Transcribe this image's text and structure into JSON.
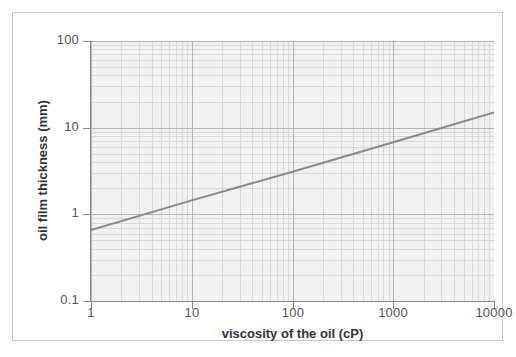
{
  "chart_data": {
    "type": "line",
    "title": "",
    "xlabel": "viscosity of the oil (cP)",
    "ylabel": "oil film thickness (mm)",
    "xscale": "log",
    "yscale": "log",
    "xlim": [
      1,
      10000
    ],
    "ylim": [
      0.1,
      100
    ],
    "xticks": [
      1,
      10,
      100,
      1000,
      10000
    ],
    "xticklabels": [
      "1",
      "10",
      "100",
      "1000",
      "10000"
    ],
    "yticks": [
      0.1,
      1,
      10,
      100
    ],
    "yticklabels": [
      "0.1",
      "1",
      "10",
      "100"
    ],
    "grid": true,
    "grid_minor": true,
    "legend": null,
    "series": [
      {
        "name": "oil film thickness vs viscosity",
        "color": "#8a8a8a",
        "linewidth": 2,
        "x": [
          1,
          10,
          100,
          1000,
          10000
        ],
        "y": [
          0.66,
          1.45,
          3.1,
          6.8,
          15.0
        ]
      }
    ]
  },
  "axes": {
    "x_title": "viscosity of the oil (cP)",
    "y_title": "oil film thickness (mm)",
    "x_tick_labels": [
      "1",
      "10",
      "100",
      "1000",
      "10000"
    ],
    "y_tick_labels": [
      "100",
      "10",
      "1",
      "0.1"
    ]
  },
  "colors": {
    "line": "#8a8a8a",
    "plot_background": "#f2f2f2",
    "grid_major": "#b4b4b4",
    "grid_minor": "#d8d8d8",
    "axis": "#8c8c8c",
    "frame": "#c9c9c9",
    "tick_text": "#555555",
    "title_text": "#333333"
  }
}
